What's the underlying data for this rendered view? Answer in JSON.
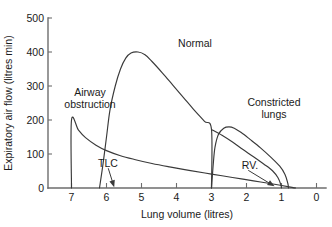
{
  "chart_data": {
    "type": "line",
    "title": "",
    "xlabel": "Lung volume (litres)",
    "ylabel": "Expiratory air flow (litres min)",
    "xlim": [
      7.6,
      0.0
    ],
    "ylim": [
      0,
      500
    ],
    "x_axis_reversed": true,
    "xticks": [
      7,
      6,
      5,
      4,
      3,
      2,
      1,
      0
    ],
    "xtick_labels": [
      "7",
      "6",
      "5",
      "4",
      "3",
      "2",
      "1",
      "0"
    ],
    "yticks": [
      0,
      100,
      200,
      300,
      400,
      500
    ],
    "ytick_labels": [
      "0",
      "100",
      "200",
      "300",
      "400",
      "500"
    ],
    "grid": false,
    "legend": "inline-annotations",
    "series": [
      {
        "name": "Airway obstruction",
        "label": "Airway obstruction",
        "label_line1": "Airway",
        "label_line2": "obstruction",
        "points": [
          [
            7.0,
            0
          ],
          [
            7.0,
            200
          ],
          [
            6.8,
            170
          ],
          [
            6.6,
            148
          ],
          [
            6.3,
            126
          ],
          [
            6.0,
            110
          ],
          [
            5.6,
            95
          ],
          [
            5.2,
            84
          ],
          [
            4.7,
            72
          ],
          [
            4.2,
            62
          ],
          [
            3.6,
            51
          ],
          [
            3.0,
            41
          ],
          [
            2.4,
            31
          ],
          [
            1.8,
            21
          ],
          [
            1.2,
            11
          ],
          [
            0.7,
            2
          ],
          [
            0.6,
            0
          ]
        ]
      },
      {
        "name": "Normal",
        "label": "Normal",
        "points": [
          [
            6.2,
            0
          ],
          [
            6.1,
            70
          ],
          [
            6.0,
            150
          ],
          [
            5.9,
            230
          ],
          [
            5.75,
            300
          ],
          [
            5.6,
            350
          ],
          [
            5.45,
            382
          ],
          [
            5.3,
            397
          ],
          [
            5.1,
            400
          ],
          [
            4.9,
            392
          ],
          [
            4.7,
            372
          ],
          [
            4.4,
            338
          ],
          [
            4.1,
            302
          ],
          [
            3.8,
            266
          ],
          [
            3.5,
            230
          ],
          [
            3.2,
            196
          ],
          [
            3.0,
            172
          ],
          [
            3.0,
            0
          ]
        ]
      },
      {
        "name": "Constricted lungs",
        "label": "Constricted lungs",
        "label_line1": "Constricted",
        "label_line2": "lungs",
        "points": [
          [
            3.0,
            0
          ],
          [
            2.95,
            70
          ],
          [
            2.9,
            120
          ],
          [
            2.8,
            158
          ],
          [
            2.65,
            176
          ],
          [
            2.5,
            180
          ],
          [
            2.35,
            176
          ],
          [
            2.15,
            163
          ],
          [
            1.9,
            143
          ],
          [
            1.6,
            118
          ],
          [
            1.3,
            90
          ],
          [
            1.05,
            64
          ],
          [
            0.9,
            40
          ],
          [
            0.82,
            14
          ],
          [
            0.8,
            0
          ]
        ]
      },
      {
        "name": "Constricted lungs inner",
        "label": "",
        "points": [
          [
            3.0,
            172
          ],
          [
            2.7,
            155
          ],
          [
            2.4,
            135
          ],
          [
            2.1,
            113
          ],
          [
            1.8,
            92
          ],
          [
            1.5,
            70
          ],
          [
            1.25,
            50
          ],
          [
            1.1,
            30
          ],
          [
            1.02,
            10
          ],
          [
            1.0,
            0
          ]
        ]
      }
    ],
    "annotations": [
      {
        "name": "TLC",
        "label": "TLC",
        "text_x": 5.95,
        "text_y": 58,
        "target_x": 5.78,
        "target_y": 2
      },
      {
        "name": "RV",
        "label": "RV.",
        "text_x": 1.95,
        "text_y": 52,
        "target_x": 1.2,
        "target_y": 5
      }
    ],
    "curve_labels": [
      {
        "name": "Normal",
        "x": 4.1,
        "y": 440
      },
      {
        "name": "Airway obstruction",
        "x": 6.35,
        "y": 280
      },
      {
        "name": "Constricted lungs",
        "x": 1.55,
        "y": 265
      }
    ]
  }
}
